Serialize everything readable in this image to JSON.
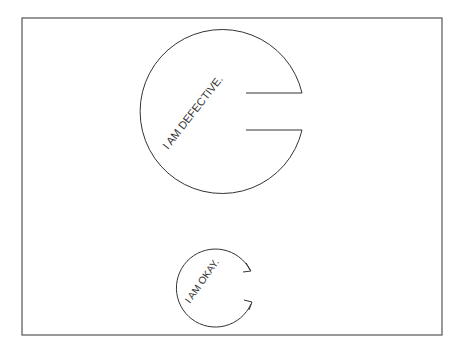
{
  "illustration": {
    "frame": {
      "stroke": "#555555"
    },
    "defective_circle": {
      "label": "I AM DEFECTIVE.",
      "stroke": "#333333"
    },
    "okay_circle": {
      "label": "I AM OKAY.",
      "stroke": "#333333"
    }
  }
}
